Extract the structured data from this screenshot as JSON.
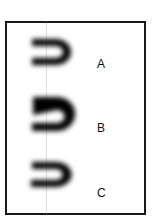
{
  "figure": {
    "background_color": "#ffffff",
    "frame_color": "#1a1a1a",
    "ink_color": "#000000",
    "guide_line_color": "#969696",
    "panels": [
      {
        "id": "a",
        "label": "A",
        "shape_description": "blurred reversed-C horseshoe glyph opening to the left"
      },
      {
        "id": "b",
        "label": "B",
        "shape_description": "blurred S-like horseshoe glyph with slanted inner stroke"
      },
      {
        "id": "c",
        "label": "C",
        "shape_description": "blurred reversed-C horseshoe glyph, smaller and rounder"
      }
    ]
  }
}
